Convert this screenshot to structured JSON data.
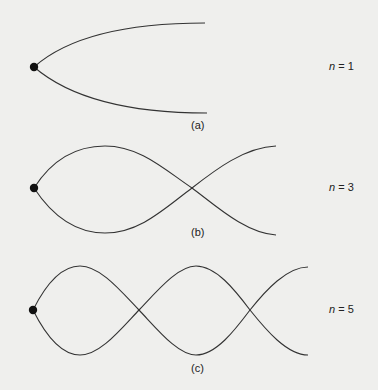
{
  "panels": [
    {
      "id": "a",
      "caption": "(a)",
      "n_var": "n",
      "n_text": " = 1"
    },
    {
      "id": "b",
      "caption": "(b)",
      "n_var": "n",
      "n_text": " = 3"
    },
    {
      "id": "c",
      "caption": "(c)",
      "n_var": "n",
      "n_text": " = 5"
    }
  ],
  "colors": {
    "background": "#efefed",
    "line": "#333333",
    "dot": "#111111"
  }
}
